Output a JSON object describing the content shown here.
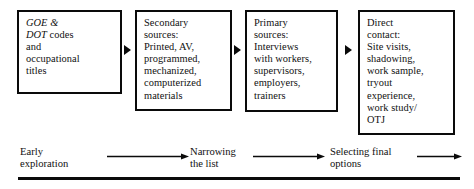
{
  "diagram": {
    "ink_color": "#0a0a0a",
    "background_color": "#ffffff",
    "boxes": [
      {
        "id": "box-1",
        "italic_lead": "GOE &\nDOT",
        "text": " codes\nand\noccupational\ntitles"
      },
      {
        "id": "box-2",
        "text": "Secondary\nsources:\nPrinted, AV,\nprogrammed,\nmechanized,\ncomputerized\nmaterials"
      },
      {
        "id": "box-3",
        "text": "Primary\nsources:\nInterviews\nwith workers,\nsupervisors,\nemployers,\ntrainers"
      },
      {
        "id": "box-4",
        "text": "Direct\ncontact:\nSite visits,\nshadowing,\nwork sample,\ntryout\nexperience,\nwork study/\nOTJ"
      }
    ],
    "connectors": [
      {
        "id": "conn-1",
        "glyph": "triangle-right"
      },
      {
        "id": "conn-2",
        "glyph": "triangle-right"
      },
      {
        "id": "conn-3",
        "glyph": "triangle-right"
      }
    ],
    "stages": [
      {
        "id": "stage-1",
        "label": "Early\nexploration"
      },
      {
        "id": "stage-2",
        "label": "Narrowing\nthe list"
      },
      {
        "id": "stage-3",
        "label": "Selecting final\noptions"
      }
    ],
    "stage_arrows": [
      {
        "id": "arrow-1",
        "glyph": "arrow-right"
      },
      {
        "id": "arrow-2",
        "glyph": "arrow-right"
      },
      {
        "id": "arrow-3",
        "glyph": "arrow-right"
      }
    ]
  }
}
